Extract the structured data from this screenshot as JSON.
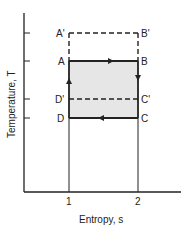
{
  "diagram": {
    "title": "",
    "type": "T-s diagram (Carnot cycle)",
    "x_axis": {
      "label": "Entropy, s",
      "ticks": [
        "1",
        "2"
      ]
    },
    "y_axis": {
      "label": "Temperature, T"
    },
    "points": {
      "A_prime": "A'",
      "B_prime": "B'",
      "A": "A",
      "B": "B",
      "D_prime": "D'",
      "C_prime": "C'",
      "D": "D",
      "C": "C"
    },
    "cycle": {
      "path": [
        "A",
        "B",
        "C",
        "D",
        "A"
      ],
      "arrows": [
        "A→B (right)",
        "B→C (down)",
        "C→D (left)",
        "D→A (up)"
      ],
      "shaded_region": "ABCD"
    },
    "dashed_cycles": [
      {
        "name": "A'B' upper isotherm",
        "from": "A'",
        "to": "B'"
      },
      {
        "name": "D'C' intermediate isotherm",
        "from": "D'",
        "to": "C'"
      }
    ],
    "colors": {
      "line": "#222222",
      "fill": "#e6e6e6",
      "background": "#ffffff"
    }
  }
}
